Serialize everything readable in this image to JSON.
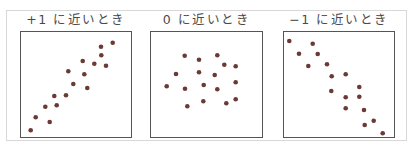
{
  "panels": [
    {
      "title": "+1 に近いとき",
      "correlation": "positive"
    },
    {
      "title": "0 に近いとき",
      "correlation": "none"
    },
    {
      "title": "−1 に近いとき",
      "correlation": "negative"
    }
  ],
  "colors": {
    "dot": "#6b3a34",
    "border": "#555555",
    "frame": "#d8d8d8",
    "text": "#4a4a4a"
  },
  "chart_data": [
    {
      "type": "scatter",
      "title": "+1 に近いとき",
      "points": [
        [
          30.7,
          130.3
        ],
        [
          35.7,
          117.3
        ],
        [
          49.7,
          122
        ],
        [
          45.3,
          106.7
        ],
        [
          56.7,
          105.3
        ],
        [
          54.3,
          96
        ],
        [
          66,
          95.3
        ],
        [
          73.3,
          84
        ],
        [
          87.3,
          88
        ],
        [
          68.3,
          71.3
        ],
        [
          84.3,
          74.3
        ],
        [
          82.7,
          61
        ],
        [
          94.3,
          63.7
        ],
        [
          106,
          65.7
        ],
        [
          101.3,
          55.3
        ],
        [
          101,
          46.7
        ],
        [
          112.7,
          42.7
        ]
      ]
    },
    {
      "type": "scatter",
      "title": "0 に近いとき",
      "points": [
        [
          184.7,
          55.7
        ],
        [
          199,
          59.7
        ],
        [
          217.3,
          55.3
        ],
        [
          224.3,
          64.7
        ],
        [
          235.7,
          66.3
        ],
        [
          176,
          74
        ],
        [
          199,
          72.3
        ],
        [
          214.7,
          75
        ],
        [
          166.7,
          86.3
        ],
        [
          185,
          88.7
        ],
        [
          203.7,
          85
        ],
        [
          217.3,
          89.3
        ],
        [
          235.7,
          82.3
        ],
        [
          187.3,
          106.3
        ],
        [
          203.3,
          101.3
        ],
        [
          226.3,
          103.3
        ],
        [
          235.7,
          99.3
        ]
      ]
    },
    {
      "type": "scatter",
      "title": "−1 に近いとき",
      "points": [
        [
          289.3,
          41
        ],
        [
          312.7,
          43.7
        ],
        [
          299,
          53.7
        ],
        [
          317.7,
          54
        ],
        [
          308.3,
          66
        ],
        [
          327,
          64.3
        ],
        [
          331.7,
          76.3
        ],
        [
          345.7,
          74.3
        ],
        [
          359.3,
          87
        ],
        [
          331.3,
          91
        ],
        [
          345.7,
          97.3
        ],
        [
          359.3,
          96.7
        ],
        [
          345.7,
          108.3
        ],
        [
          364,
          110
        ],
        [
          373.7,
          120.7
        ],
        [
          364.7,
          125
        ],
        [
          382.7,
          133.3
        ]
      ]
    }
  ]
}
